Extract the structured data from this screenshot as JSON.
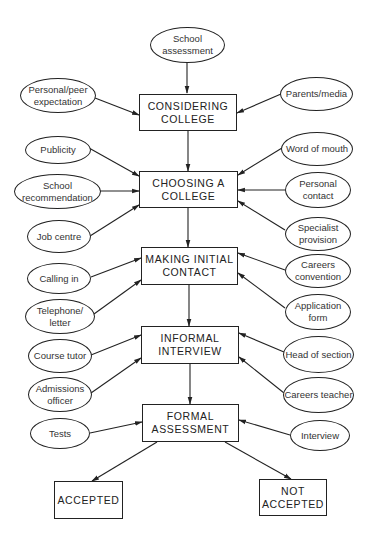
{
  "stages": [
    {
      "id": "considering",
      "label": "CONSIDERING\nCOLLEGE"
    },
    {
      "id": "choosing",
      "label": "CHOOSING A\nCOLLEGE"
    },
    {
      "id": "making",
      "label": "MAKING INITIAL\nCONTACT"
    },
    {
      "id": "informal",
      "label": "INFORMAL\nINTERVIEW"
    },
    {
      "id": "formal",
      "label": "FORMAL\nASSESSMENT"
    }
  ],
  "outcomes": [
    {
      "id": "accepted",
      "label": "ACCEPTED"
    },
    {
      "id": "not_accepted",
      "label": "NOT\nACCEPTED"
    }
  ],
  "influences": {
    "considering": {
      "top": "School\nassessment",
      "left": [
        "Personal/peer\nexpectation"
      ],
      "right": [
        "Parents/media"
      ]
    },
    "choosing": {
      "left": [
        "Publicity",
        "School\nrecommendation",
        "Job centre"
      ],
      "right": [
        "Word of mouth",
        "Personal\ncontact",
        "Specialist\nprovision"
      ]
    },
    "making": {
      "left": [
        "Calling in",
        "Telephone/\nletter"
      ],
      "right": [
        "Careers\nconvention",
        "Application\nform"
      ]
    },
    "informal": {
      "left": [
        "Course tutor",
        "Admissions\nofficer"
      ],
      "right": [
        "Head of section",
        "Careers teacher"
      ]
    },
    "formal": {
      "left": [
        "Tests"
      ],
      "right": [
        "Interview"
      ]
    }
  },
  "colors": {
    "line": "#222222",
    "background": "#ffffff"
  }
}
